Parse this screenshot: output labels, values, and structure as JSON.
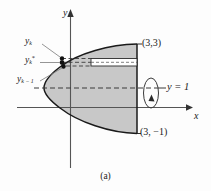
{
  "figure": {
    "caption": "(a)",
    "axes": {
      "y_axis_label": "y",
      "x_axis_label": "x"
    },
    "annotations": {
      "y_k": {
        "base": "y",
        "sub": "k"
      },
      "y_k_star": {
        "base": "y",
        "sub": "k",
        "sup": "*"
      },
      "y_k_minus_1": {
        "base": "y",
        "sub": "k − 1"
      },
      "point_top": "(3,3)",
      "point_bottom": "(3, −1)",
      "axis_of_revolution": "y = 1"
    },
    "colors": {
      "region_fill": "#c8c8c8",
      "slice_fill": "#ffffff",
      "curve_stroke": "#1a1a1a",
      "axis_stroke": "#555555",
      "dashed_stroke": "#3a3a3a",
      "leader_stroke": "#777777",
      "text": "#1a1a1a"
    },
    "geometry": {
      "region_description": "Region bounded by leftward-opening parabola and vertical line x = 3, from (3,-1) to (3,3)",
      "revolution_axis_y": 1,
      "vertical_boundary_x": 3,
      "top_corner": [
        3,
        3
      ],
      "bottom_corner": [
        3,
        -1
      ]
    }
  }
}
